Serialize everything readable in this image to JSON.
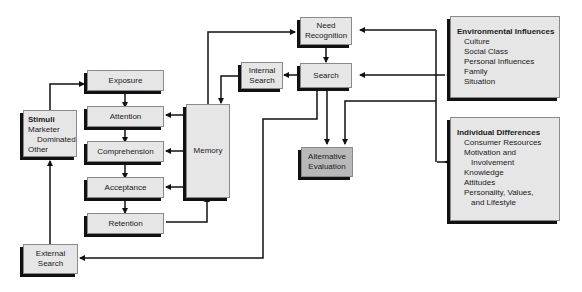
{
  "nodes": {
    "stimuli": {
      "title": "Stimuli",
      "lines": [
        "Marketer",
        "Dominated",
        "Other"
      ]
    },
    "exposure": "Exposure",
    "attention": "Attention",
    "comprehension": "Comprehension",
    "acceptance": "Acceptance",
    "retention": "Retention",
    "memory": "Memory",
    "internal_search": [
      "Internal",
      "Search"
    ],
    "need_recognition": [
      "Need",
      "Recognition"
    ],
    "search": "Search",
    "alternative_evaluation": [
      "Alternative",
      "Evaluation"
    ],
    "external_search": [
      "External",
      "Search"
    ],
    "environmental_influences": {
      "title": "Environmental Influences",
      "items": [
        "Culture",
        "Social Class",
        "Personal Influences",
        "Family",
        "Situation"
      ]
    },
    "individual_differences": {
      "title": "Individual Differences",
      "items": [
        "Consumer Resources",
        "Motivation and",
        "Involvement",
        "Knowledge",
        "Attitudes",
        "Personality, Values,",
        "and Lifestyle"
      ]
    }
  },
  "colors": {
    "box_fill": "#e6e6e6",
    "highlight_fill": "#b8b8b8",
    "shadow": "#111111",
    "line": "#111111"
  }
}
